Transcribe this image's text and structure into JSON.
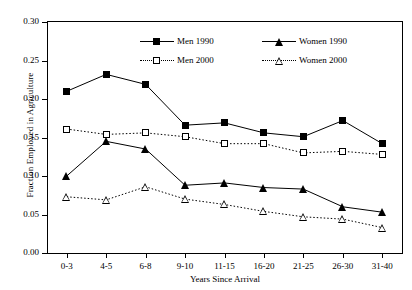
{
  "chart_data": {
    "type": "line",
    "title": "",
    "xlabel": "Years Since Arrival",
    "ylabel": "Fraction Employed in Agriculture",
    "categories": [
      "0-3",
      "4-5",
      "6-8",
      "9-10",
      "11-15",
      "16-20",
      "21-25",
      "26-30",
      "31-40"
    ],
    "ylim": [
      0.0,
      0.3
    ],
    "yticks": [
      "0.00",
      "0.05",
      "0.10",
      "0.15",
      "0.20",
      "0.25",
      "0.30"
    ],
    "ytick_values": [
      0.0,
      0.05,
      0.1,
      0.15,
      0.2,
      0.25,
      0.3
    ],
    "grid": false,
    "legend_position": "top-center",
    "series": [
      {
        "name": "Men 1990",
        "marker": "filled-square",
        "line": "solid",
        "color": "#000000",
        "values": [
          0.21,
          0.232,
          0.219,
          0.166,
          0.169,
          0.156,
          0.151,
          0.172,
          0.142
        ]
      },
      {
        "name": "Women 1990",
        "marker": "filled-triangle",
        "line": "solid",
        "color": "#000000",
        "values": [
          0.1,
          0.145,
          0.135,
          0.088,
          0.091,
          0.085,
          0.083,
          0.06,
          0.053
        ]
      },
      {
        "name": "Men 2000",
        "marker": "open-square",
        "line": "dotted",
        "color": "#000000",
        "values": [
          0.161,
          0.154,
          0.156,
          0.151,
          0.142,
          0.142,
          0.13,
          0.132,
          0.128
        ]
      },
      {
        "name": "Women 2000",
        "marker": "open-triangle",
        "line": "dotted",
        "color": "#000000",
        "values": [
          0.073,
          0.069,
          0.086,
          0.07,
          0.063,
          0.054,
          0.047,
          0.044,
          0.033
        ]
      }
    ]
  },
  "axes": {
    "y_title": "Fraction Employed in Agriculture",
    "x_title": "Years Since Arrival"
  },
  "legend": {
    "items": [
      {
        "label": "Men 1990"
      },
      {
        "label": "Women 1990"
      },
      {
        "label": "Men 2000"
      },
      {
        "label": "Women 2000"
      }
    ]
  }
}
